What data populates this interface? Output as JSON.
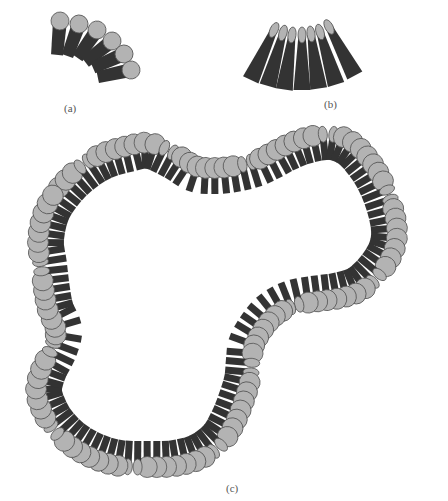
{
  "figure": {
    "colors": {
      "head_fill": "#b3b3b3",
      "head_stroke": "#555555",
      "tail": "#333333",
      "background": "#ffffff"
    },
    "panels": [
      {
        "id": "a",
        "label": "(a)",
        "label_pos": [
          71,
          112
        ],
        "description": "Fan of lipids with round heads (positive curvature)"
      },
      {
        "id": "b",
        "label": "(b)",
        "label_pos": [
          328,
          107
        ],
        "description": "Fan of wedge-shaped lipids with small heads (negative curvature)"
      },
      {
        "id": "c",
        "label": "(c)",
        "label_pos": [
          231,
          494
        ],
        "description": "Closed lipid monolayer loop mixing both lipid shapes"
      }
    ],
    "panel_a": {
      "lipids": [
        {
          "hx": 60,
          "hy": 21,
          "angle": 185,
          "r": 9
        },
        {
          "hx": 79,
          "hy": 24,
          "angle": 200,
          "r": 9
        },
        {
          "hx": 97,
          "hy": 30,
          "angle": 215,
          "r": 9
        },
        {
          "hx": 112,
          "hy": 41,
          "angle": 232,
          "r": 9
        },
        {
          "hx": 124,
          "hy": 54,
          "angle": 246,
          "r": 9
        },
        {
          "hx": 131,
          "hy": 70,
          "angle": 258,
          "r": 9
        }
      ]
    },
    "panel_b": {
      "lipids": [
        {
          "hx": 274,
          "hy": 30,
          "angle": 205
        },
        {
          "hx": 283,
          "hy": 33,
          "angle": 196
        },
        {
          "hx": 292,
          "hy": 35,
          "angle": 188
        },
        {
          "hx": 302,
          "hy": 35,
          "angle": 180
        },
        {
          "hx": 311,
          "hy": 34,
          "angle": 172
        },
        {
          "hx": 320,
          "hy": 32,
          "angle": 163
        },
        {
          "hx": 329,
          "hy": 27,
          "angle": 152
        }
      ]
    },
    "panel_c": {
      "center": [
        230,
        300
      ],
      "outline": [
        [
          62,
          190
        ],
        [
          80,
          172
        ],
        [
          102,
          158
        ],
        [
          128,
          150
        ],
        [
          150,
          147
        ],
        [
          175,
          158
        ],
        [
          195,
          170
        ],
        [
          215,
          172
        ],
        [
          235,
          170
        ],
        [
          255,
          165
        ],
        [
          270,
          158
        ],
        [
          285,
          150
        ],
        [
          305,
          142
        ],
        [
          330,
          138
        ],
        [
          350,
          145
        ],
        [
          365,
          160
        ],
        [
          378,
          180
        ],
        [
          388,
          205
        ],
        [
          393,
          230
        ],
        [
          390,
          250
        ],
        [
          378,
          270
        ],
        [
          360,
          287
        ],
        [
          340,
          294
        ],
        [
          320,
          297
        ],
        [
          300,
          300
        ],
        [
          285,
          305
        ],
        [
          270,
          315
        ],
        [
          258,
          330
        ],
        [
          250,
          345
        ],
        [
          248,
          360
        ],
        [
          246,
          380
        ],
        [
          240,
          400
        ],
        [
          232,
          420
        ],
        [
          220,
          440
        ],
        [
          200,
          455
        ],
        [
          175,
          462
        ],
        [
          150,
          463
        ],
        [
          120,
          462
        ],
        [
          95,
          455
        ],
        [
          72,
          442
        ],
        [
          55,
          425
        ],
        [
          45,
          408
        ],
        [
          40,
          390
        ],
        [
          45,
          370
        ],
        [
          55,
          350
        ],
        [
          60,
          330
        ],
        [
          52,
          310
        ],
        [
          48,
          290
        ],
        [
          45,
          265
        ],
        [
          42,
          240
        ],
        [
          48,
          212
        ]
      ],
      "lipid_count": 120,
      "tail_length": 26,
      "head_r": 10
    }
  }
}
